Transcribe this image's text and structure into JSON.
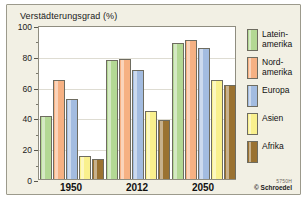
{
  "chart_data": {
    "type": "bar",
    "title": "Verstädterungsgrad (%)",
    "xlabel": "",
    "ylabel": "",
    "ylim": [
      0,
      100
    ],
    "yticks": [
      0,
      20,
      40,
      60,
      80,
      100
    ],
    "grid": true,
    "legend_position": "right",
    "categories": [
      "1950",
      "2012",
      "2050"
    ],
    "series": [
      {
        "name": "Latein-\namerika",
        "color": "#b3d894",
        "values": [
          41,
          77,
          88
        ]
      },
      {
        "name": "Nord-\namerika",
        "color": "#f6b183",
        "values": [
          64,
          78,
          90
        ]
      },
      {
        "name": "Europa",
        "color": "#a3bce0",
        "values": [
          52,
          71,
          85
        ]
      },
      {
        "name": "Asien",
        "color": "#f9f08d",
        "values": [
          15,
          44,
          64
        ]
      },
      {
        "name": "Afrika",
        "color": "#9a7231",
        "values": [
          13,
          38,
          61
        ]
      }
    ]
  },
  "credit": {
    "code": "5750H",
    "owner": "© Schroedel"
  },
  "caption": {
    "number": "M5",
    "text": "Verstädterungsgrad nach Regionen"
  }
}
